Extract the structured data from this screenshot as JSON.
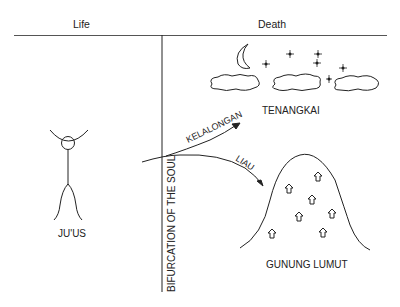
{
  "header": {
    "life_label": "Life",
    "death_label": "Death"
  },
  "figure": {
    "name": "JU'US",
    "left_label": "JU'US"
  },
  "divider": {
    "label": "BIFURCATION OF THE SOUL"
  },
  "paths": [
    {
      "label": "KELALONGAN",
      "destination": "TENANGKAI"
    },
    {
      "label": "LIAU",
      "destination": "GUNUNG LUMUT"
    }
  ],
  "destinations": {
    "sky": {
      "label": "TENANGKAI",
      "elements": [
        "crescent-moon",
        "stars",
        "clouds"
      ]
    },
    "mountain": {
      "label": "GUNUNG LUMUT",
      "house_count": 7
    }
  },
  "colors": {
    "line": "#222222",
    "text": "#222222",
    "background": "#ffffff"
  }
}
